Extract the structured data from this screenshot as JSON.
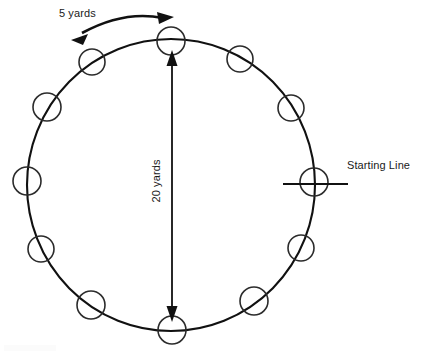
{
  "diagram": {
    "background_color": "#ffffff",
    "stroke_color": "#111111",
    "marker_stroke_color": "#2b2b2b",
    "labels": {
      "spacing": "5 yards",
      "diameter": "20 yards",
      "starting_line": "Starting Line"
    },
    "track": {
      "center_x": 171,
      "center_y": 185,
      "radius_x": 144,
      "radius_y": 146
    },
    "runner_markers": [
      {
        "name": "runner-marker-top",
        "cx": 171,
        "cy": 41,
        "r": 14
      },
      {
        "name": "runner-marker-upper-right",
        "cx": 240,
        "cy": 59,
        "r": 13
      },
      {
        "name": "runner-marker-right-upper",
        "cx": 291,
        "cy": 108,
        "r": 13
      },
      {
        "name": "runner-marker-right-start",
        "cx": 314,
        "cy": 182,
        "r": 14
      },
      {
        "name": "runner-marker-right-lower",
        "cx": 301,
        "cy": 248,
        "r": 13
      },
      {
        "name": "runner-marker-lower-right",
        "cx": 254,
        "cy": 301,
        "r": 14
      },
      {
        "name": "runner-marker-bottom",
        "cx": 172,
        "cy": 330,
        "r": 14
      },
      {
        "name": "runner-marker-lower-left",
        "cx": 91,
        "cy": 305,
        "r": 14
      },
      {
        "name": "runner-marker-left-lower",
        "cx": 41,
        "cy": 249,
        "r": 13
      },
      {
        "name": "runner-marker-left-start",
        "cx": 27,
        "cy": 181,
        "r": 14
      },
      {
        "name": "runner-marker-left-upper",
        "cx": 47,
        "cy": 107,
        "r": 14
      },
      {
        "name": "runner-marker-upper-left",
        "cx": 92,
        "cy": 62,
        "r": 13
      }
    ],
    "starting_line_tick": {
      "x1": 283,
      "x2": 348,
      "y": 184
    },
    "diameter_arrow": {
      "x": 172,
      "y_top": 55,
      "y_bottom": 318
    },
    "spacing_arc": {
      "from_x": 74,
      "from_y": 38,
      "to_x": 171,
      "to_y": 16
    }
  }
}
